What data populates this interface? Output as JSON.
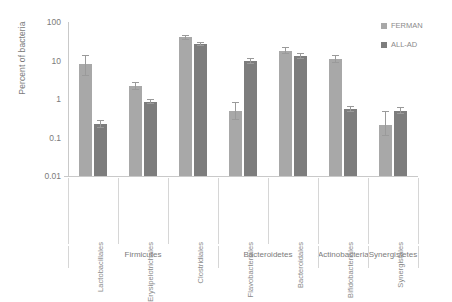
{
  "chart_data": {
    "type": "bar",
    "title": "",
    "xlabel": "",
    "ylabel": "Percent of bacteria",
    "yscale": "log",
    "ylim": [
      0.01,
      100
    ],
    "yticks": [
      "100",
      "10",
      "1",
      "0.1",
      "0.01"
    ],
    "ytick_values": [
      100,
      10,
      1,
      0.1,
      0.01
    ],
    "grid": false,
    "legend_position": "top-right",
    "categories": [
      "Lactobacillales",
      "Erysipelotrichales",
      "Clostridiales",
      "Flavobacteriales",
      "Bacteroidales",
      "Bifidobacteriales",
      "Synergistales"
    ],
    "series": [
      {
        "name": "FERMAN",
        "color": "#a8a8a8",
        "values": [
          8.0,
          2.2,
          40.0,
          0.5,
          18.0,
          11.0,
          0.21
        ],
        "errors_low": [
          4.0,
          0.45,
          5.0,
          0.22,
          3.5,
          2.2,
          0.1
        ],
        "errors_high": [
          6.0,
          0.6,
          6.0,
          0.35,
          4.0,
          2.6,
          0.28
        ]
      },
      {
        "name": "ALL-AD",
        "color": "#7d7d7d",
        "values": [
          0.23,
          0.85,
          27.0,
          9.5,
          13.0,
          0.55,
          0.5
        ],
        "errors_low": [
          0.05,
          0.12,
          2.5,
          1.6,
          2.0,
          0.09,
          0.09
        ],
        "errors_high": [
          0.06,
          0.14,
          3.0,
          2.0,
          2.4,
          0.11,
          0.11
        ]
      }
    ],
    "groups": [
      {
        "label": "Firmicutes",
        "categories": [
          "Lactobacillales",
          "Erysipelotrichales",
          "Clostridiales"
        ]
      },
      {
        "label": "Bacteroidetes",
        "categories": [
          "Flavobacteriales",
          "Bacteroidales"
        ]
      },
      {
        "label": "Actinobacteria",
        "categories": [
          "Bifidobacteriales"
        ]
      },
      {
        "label": "Synergistetes",
        "categories": [
          "Synergistales"
        ]
      }
    ]
  },
  "legend": {
    "items": [
      {
        "label": "FERMAN"
      },
      {
        "label": "ALL-AD"
      }
    ]
  }
}
